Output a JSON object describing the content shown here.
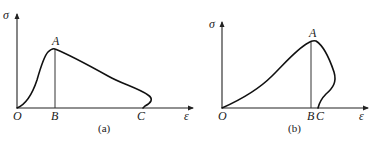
{
  "figures": [
    {
      "id": "a",
      "caption": "(a)",
      "y_axis_label": "σ",
      "x_axis_label": "ε",
      "points": {
        "O": "O",
        "A": "A",
        "B": "B",
        "C": "C"
      },
      "description": "Stress-strain curve rising from O to peak A, then descending with a hook back to C on the strain axis; vertical line from A to B"
    },
    {
      "id": "b",
      "caption": "(b)",
      "y_axis_label": "σ",
      "x_axis_label": "ε",
      "points": {
        "O": "O",
        "A": "A",
        "B": "B",
        "C": "C"
      },
      "description": "Stress-strain curve rising gradually from O to peak A, then curving back (snap-back) down to C just right of B; vertical line from A to B"
    }
  ],
  "colors": {
    "line": "#111111",
    "background": "#ffffff"
  }
}
